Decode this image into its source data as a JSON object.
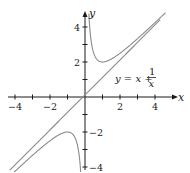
{
  "chart_data": {
    "type": "line",
    "title": "",
    "xlabel": "x",
    "ylabel": "y",
    "xlim": [
      -4.5,
      4.6
    ],
    "ylim": [
      -4.3,
      4.8
    ],
    "x_ticks": [
      -4,
      -3,
      -2,
      -1,
      1,
      2,
      3,
      4
    ],
    "x_tick_labels": [
      {
        "value": -4,
        "label": "−4"
      },
      {
        "value": -2,
        "label": "−2"
      },
      {
        "value": 2,
        "label": "2"
      },
      {
        "value": 4,
        "label": "4"
      }
    ],
    "y_ticks": [
      -4,
      -3,
      -2,
      -1,
      1,
      2,
      3,
      4
    ],
    "y_tick_labels": [
      {
        "value": 4,
        "label": "4"
      },
      {
        "value": 2,
        "label": "2"
      },
      {
        "value": -2,
        "label": "−2"
      },
      {
        "value": -4,
        "label": "−4"
      }
    ],
    "grid": false,
    "series": [
      {
        "name": "y = x + 1/x",
        "function": "x + 1/x",
        "domain": [
          [
            -4.5,
            -0.22
          ],
          [
            0.22,
            4.6
          ]
        ],
        "color": "#8a8a8a"
      },
      {
        "name": "asymptote y = x",
        "function": "x",
        "domain": [
          [
            -4.3,
            4.3
          ]
        ],
        "color": "#8a8a8a"
      }
    ],
    "annotations": [
      {
        "text": "y = x + 1/x",
        "x": 2.6,
        "y": 1.5
      }
    ]
  },
  "labels": {
    "x_axis": "x",
    "y_axis": "y",
    "equation_lhs": "y",
    "equation_eq": " = ",
    "equation_x": "x",
    "equation_plus": " + ",
    "equation_num": "1",
    "equation_den": "x"
  }
}
